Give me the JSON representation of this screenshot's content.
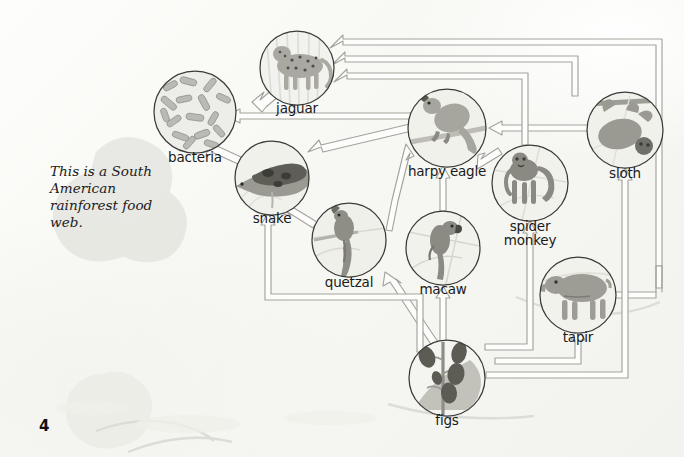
{
  "page": {
    "number": "4",
    "caption": "This is a South American rainforest food web.",
    "background_color": "#fbfbf9",
    "arrow_color": "#9a9a96",
    "circle_stroke": "#3a3a38"
  },
  "organisms": [
    {
      "id": "bacteria",
      "label": "bacteria",
      "cx": 195,
      "cy": 112,
      "r": 41,
      "label_x": 195,
      "label_y": 158,
      "art": "bacteria-art"
    },
    {
      "id": "jaguar",
      "label": "jaguar",
      "cx": 297,
      "cy": 68,
      "r": 37,
      "label_x": 297,
      "label_y": 109,
      "art": "jaguar-art"
    },
    {
      "id": "snake",
      "label": "snake",
      "cx": 272,
      "cy": 178,
      "r": 37,
      "label_x": 272,
      "label_y": 219,
      "art": "snake-art"
    },
    {
      "id": "quetzal",
      "label": "quetzal",
      "cx": 349,
      "cy": 240,
      "r": 37,
      "label_x": 349,
      "label_y": 283,
      "art": "quetzal-art"
    },
    {
      "id": "macaw",
      "label": "macaw",
      "cx": 443,
      "cy": 248,
      "r": 37,
      "label_x": 443,
      "label_y": 290,
      "art": "macaw-art"
    },
    {
      "id": "harpy_eagle",
      "label": "harpy eagle",
      "cx": 447,
      "cy": 128,
      "r": 39,
      "label_x": 447,
      "label_y": 172,
      "art": "harpy-eagle-art"
    },
    {
      "id": "spider_monkey",
      "label": "spider monkey",
      "cx": 530,
      "cy": 183,
      "r": 38,
      "label_x": 530,
      "label_y": 227,
      "art": "spider-monkey-art"
    },
    {
      "id": "sloth",
      "label": "sloth",
      "cx": 625,
      "cy": 130,
      "r": 38,
      "label_x": 625,
      "label_y": 174,
      "art": "sloth-art"
    },
    {
      "id": "tapir",
      "label": "tapir",
      "cx": 578,
      "cy": 295,
      "r": 38,
      "label_x": 578,
      "label_y": 338,
      "art": "tapir-art"
    },
    {
      "id": "figs",
      "label": "figs",
      "cx": 447,
      "cy": 378,
      "r": 38,
      "label_x": 447,
      "label_y": 421,
      "art": "figs-art"
    }
  ],
  "food_web_links": [
    {
      "from": "jaguar",
      "to": "bacteria"
    },
    {
      "from": "snake",
      "to": "bacteria"
    },
    {
      "from": "harpy_eagle",
      "to": "bacteria"
    },
    {
      "from": "harpy_eagle",
      "to": "snake"
    },
    {
      "from": "quetzal",
      "to": "snake"
    },
    {
      "from": "figs",
      "to": "snake"
    },
    {
      "from": "quetzal",
      "to": "harpy_eagle"
    },
    {
      "from": "macaw",
      "to": "harpy_eagle"
    },
    {
      "from": "spider_monkey",
      "to": "harpy_eagle"
    },
    {
      "from": "sloth",
      "to": "harpy_eagle"
    },
    {
      "from": "figs",
      "to": "quetzal"
    },
    {
      "from": "figs",
      "to": "macaw"
    },
    {
      "from": "figs",
      "to": "spider_monkey"
    },
    {
      "from": "figs",
      "to": "tapir"
    },
    {
      "from": "figs",
      "to": "sloth"
    },
    {
      "from": "spider_monkey",
      "to": "jaguar"
    },
    {
      "from": "sloth",
      "to": "jaguar"
    },
    {
      "from": "tapir",
      "to": "jaguar"
    }
  ]
}
